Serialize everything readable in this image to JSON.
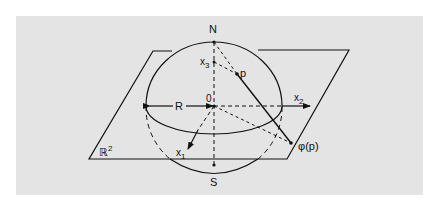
{
  "diagram": {
    "labels": {
      "north": "N",
      "south": "S",
      "origin": "0",
      "radius": "R",
      "point": "p",
      "projection": "φ(p)",
      "plane": "ℝ",
      "plane_sup": "2",
      "x1": "x",
      "x1_sub": "1",
      "x2": "x",
      "x2_sub": "2",
      "x3": "x",
      "x3_sub": "3"
    },
    "colors": {
      "background": "#e4e4e4",
      "ink": "#111111",
      "page": "#ffffff"
    }
  }
}
